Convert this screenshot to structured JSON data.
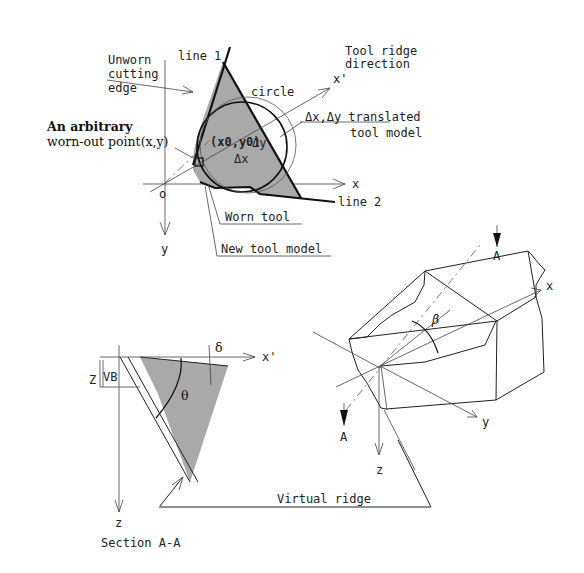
{
  "figure": {
    "top_view": {
      "labels": {
        "unworn_edge": [
          "Unworn",
          "cutting",
          "edge"
        ],
        "line1": "line 1",
        "line2": "line 2",
        "circle": "circle",
        "tool_ridge": [
          "Tool ridge",
          "direction"
        ],
        "x_prime": "x'",
        "translated": [
          "Δx,Δy translated",
          "tool model"
        ],
        "arbitrary_point": [
          "An arbitrary",
          "worn-out point(x,y)"
        ],
        "center": "(x0,y0)",
        "delta_x": "Δx",
        "delta_y": "Δy",
        "origin": "o",
        "x_axis": "x",
        "y_axis": "y",
        "worn_tool": "Worn tool",
        "new_tool_model": "New tool model"
      }
    },
    "iso_view": {
      "labels": {
        "section_a_top": "A",
        "section_a_bottom": "A",
        "x_axis": "x",
        "y_axis": "y",
        "z_axis": "z",
        "beta": "β"
      }
    },
    "section_view": {
      "labels": {
        "z_dim": "Z",
        "vb": "VB",
        "delta": "δ",
        "theta": "θ",
        "x_prime": "x'",
        "z_axis": "z",
        "title": "Section A-A"
      }
    },
    "virtual_ridge": "Virtual ridge"
  }
}
